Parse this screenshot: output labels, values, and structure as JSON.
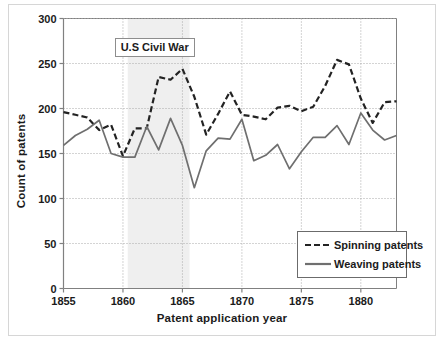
{
  "chart_data": {
    "type": "line",
    "title": "",
    "xlabel": "Patent application year",
    "ylabel": "Count of patents",
    "xlim": [
      1855,
      1883
    ],
    "ylim": [
      0,
      300
    ],
    "yticks": [
      0,
      50,
      100,
      150,
      200,
      250,
      300
    ],
    "xticks": [
      1855,
      1860,
      1865,
      1870,
      1875,
      1880
    ],
    "grid": true,
    "legend_position": "lower right",
    "x": [
      1855,
      1856,
      1857,
      1858,
      1859,
      1860,
      1861,
      1862,
      1863,
      1864,
      1865,
      1866,
      1867,
      1868,
      1869,
      1870,
      1871,
      1872,
      1873,
      1874,
      1875,
      1876,
      1877,
      1878,
      1879,
      1880,
      1881,
      1882,
      1883
    ],
    "series": [
      {
        "name": "Spinning patents",
        "style": "dashed",
        "color": "#232323",
        "values": [
          196,
          193,
          190,
          176,
          182,
          147,
          178,
          178,
          235,
          232,
          244,
          213,
          171,
          194,
          219,
          193,
          191,
          188,
          201,
          203,
          197,
          202,
          225,
          254,
          249,
          211,
          184,
          207,
          208
        ]
      },
      {
        "name": "Weaving patents",
        "style": "solid",
        "color": "#6f6f6f",
        "values": [
          159,
          170,
          177,
          187,
          150,
          146,
          146,
          180,
          154,
          189,
          159,
          112,
          153,
          167,
          166,
          188,
          142,
          148,
          160,
          133,
          152,
          168,
          168,
          181,
          160,
          195,
          176,
          165,
          170
        ]
      }
    ],
    "annotations": [
      {
        "name": "civil-war-band",
        "label": "U.S Civil War",
        "x_start": 1860.4,
        "x_end": 1865.6,
        "fill": "#efefef"
      }
    ]
  },
  "legend": {
    "entries": [
      {
        "label": "Spinning patents",
        "style": "dashed"
      },
      {
        "label": "Weaving patents",
        "style": "solid"
      }
    ]
  },
  "colors": {
    "spinning": "#232323",
    "weaving": "#6f6f6f",
    "grid": "#a8a8a8",
    "axis": "#808080",
    "band": "#efefef",
    "text": "#1b1b1b"
  }
}
